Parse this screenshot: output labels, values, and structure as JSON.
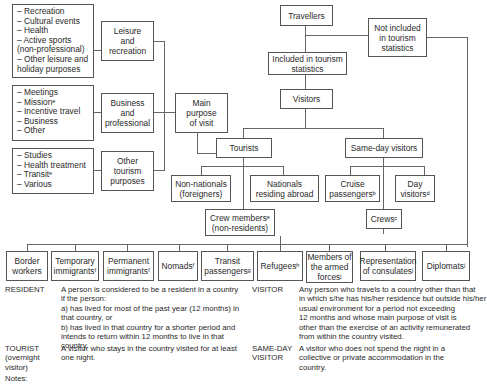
{
  "purpose_lists": {
    "leisure": "– Recreation\n– Cultural events\n– Health\n– Active sports\n   (non-professional)\n– Other leisure and\n   holiday purposes",
    "business": "– Meetings\n– Missionᵉ\n– Incentive travel\n– Business\n– Other",
    "other": "– Studies\n– Health treatment\n– Transitᵉ\n– Various"
  },
  "purpose_boxes": {
    "leisure": "Leisure\nand\nrecreation",
    "business": "Business\nand\nprofessional",
    "other": "Other\ntourism\npurposes",
    "main": "Main\npurpose\nof visit"
  },
  "hierarchy": {
    "travellers": "Travellers",
    "included": "Included in tourism\nstatistics",
    "not_included": "Not included\nin tourism\nstatistics",
    "visitors": "Visitors",
    "tourists": "Tourists",
    "same_day": "Same-day visitors",
    "non_nationals": "Non-nationals\n(foreigners)",
    "nationals_abroad": "Nationals\nresiding abroad",
    "crew_members": "Crew membersᵉ\n(non-residents)",
    "cruise": "Cruise\npassengersᵇ",
    "day_visitors": "Day\nvisitorsᵈ",
    "crews": "Crewsᶜ"
  },
  "excluded": [
    "Border\nworkers",
    "Temporary\nimmigrantsᶠ",
    "Permanent\nimmigrantsᶠ",
    "Nomadsᶠ",
    "Transit\npassengersᵍ",
    "Refugeesʰ",
    "Members of\nthe armed\nforcesʲ",
    "Representation\nof consulatesʲ",
    "Diplomatsʲ"
  ],
  "definitions": [
    {
      "term": "RESIDENT",
      "text": "A person is considered to be a resident in a country\nif the person:\na) has lived for most of the past year (12 months) in\nthat country, or\nb) has lived in that country for a shorter period and\nintends to return within 12 months to live in that country."
    },
    {
      "term": "VISITOR",
      "text": "Any person who travels to a country other than that\nin which s/he has his/her residence but outside his/her\nusual environment for a period not exceeding\n12 months and whose main purpose of visit is\nother than the exercise of an activity remunerated\nfrom within the country visited."
    },
    {
      "term": "TOURIST\n(overnight\nvisitor)",
      "text": "A visitor who stays in the country visited for at least\none night."
    },
    {
      "term": "SAME-DAY\nVISITOR",
      "text": "A visitor who does not spend the night in a\ncollective or private accommodation in the\ncountry."
    }
  ],
  "notes_label": "Notes:"
}
